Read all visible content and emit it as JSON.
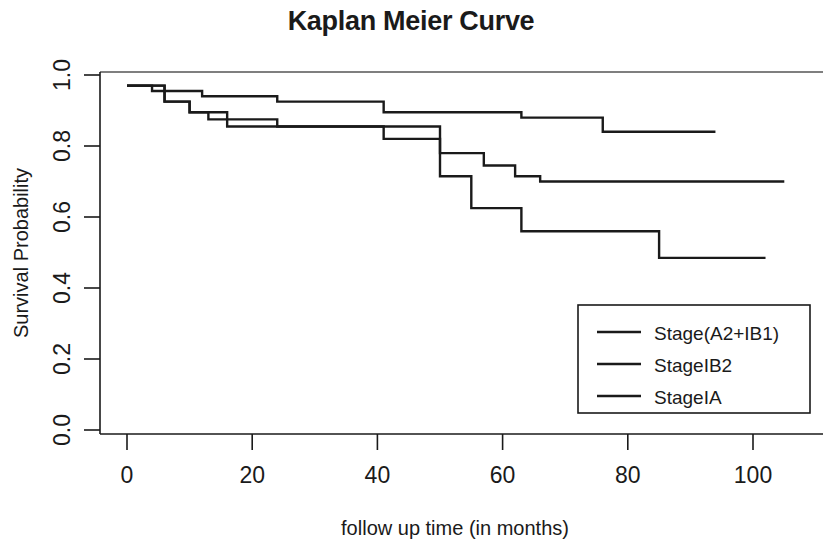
{
  "chart_data": {
    "type": "line",
    "title": "Kaplan Meier Curve",
    "xlabel": "follow up time (in months)",
    "ylabel": "Survival Probability",
    "xlim": [
      -2,
      112
    ],
    "ylim": [
      0.0,
      1.0
    ],
    "grid": false,
    "legend_position": "bottom-right",
    "xticks": [
      0,
      20,
      40,
      60,
      80,
      100
    ],
    "xtick_labels": [
      "0",
      "20",
      "40",
      "60",
      "80",
      "100"
    ],
    "yticks": [
      0.0,
      0.2,
      0.4,
      0.6,
      0.8,
      1.0
    ],
    "ytick_labels": [
      "0.0",
      "0.2",
      "0.4",
      "0.6",
      "0.8",
      "1.0"
    ],
    "series": [
      {
        "name": "Stage(A2+IB1)",
        "points": [
          [
            0,
            0.97
          ],
          [
            4,
            0.97
          ],
          [
            4,
            0.955
          ],
          [
            12,
            0.955
          ],
          [
            12,
            0.94
          ],
          [
            24,
            0.94
          ],
          [
            24,
            0.925
          ],
          [
            41,
            0.925
          ],
          [
            41,
            0.895
          ],
          [
            63,
            0.895
          ],
          [
            63,
            0.88
          ],
          [
            76,
            0.88
          ],
          [
            76,
            0.84
          ],
          [
            94,
            0.84
          ]
        ]
      },
      {
        "name": "StageIB2",
        "points": [
          [
            0,
            0.97
          ],
          [
            6,
            0.97
          ],
          [
            6,
            0.925
          ],
          [
            10,
            0.925
          ],
          [
            10,
            0.895
          ],
          [
            13,
            0.895
          ],
          [
            13,
            0.875
          ],
          [
            24,
            0.875
          ],
          [
            24,
            0.855
          ],
          [
            41,
            0.855
          ],
          [
            41,
            0.82
          ],
          [
            50,
            0.82
          ],
          [
            50,
            0.78
          ],
          [
            57,
            0.78
          ],
          [
            57,
            0.745
          ],
          [
            62,
            0.745
          ],
          [
            62,
            0.715
          ],
          [
            66,
            0.715
          ],
          [
            66,
            0.7
          ],
          [
            105,
            0.7
          ]
        ]
      },
      {
        "name": "StageIA",
        "points": [
          [
            0,
            0.97
          ],
          [
            6,
            0.97
          ],
          [
            6,
            0.925
          ],
          [
            10,
            0.925
          ],
          [
            10,
            0.895
          ],
          [
            16,
            0.895
          ],
          [
            16,
            0.855
          ],
          [
            50,
            0.855
          ],
          [
            50,
            0.715
          ],
          [
            55,
            0.715
          ],
          [
            55,
            0.625
          ],
          [
            63,
            0.625
          ],
          [
            63,
            0.56
          ],
          [
            85,
            0.56
          ],
          [
            85,
            0.485
          ],
          [
            102,
            0.485
          ]
        ]
      }
    ]
  },
  "legend": {
    "entries": [
      {
        "label": "Stage(A2+IB1)"
      },
      {
        "label": "StageIB2"
      },
      {
        "label": "StageIA"
      }
    ]
  }
}
